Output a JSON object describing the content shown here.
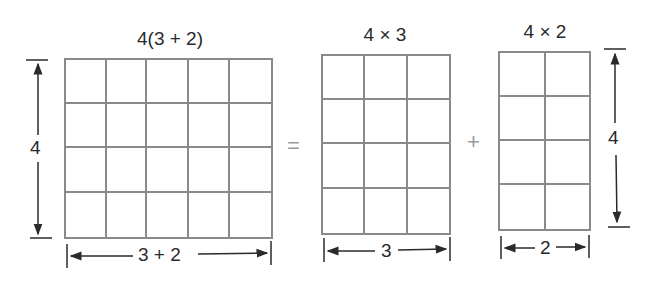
{
  "diagram": {
    "left": {
      "label": "4(3 + 2)",
      "rows": 4,
      "cols": 5,
      "height_label": "4",
      "width_label": "3 + 2"
    },
    "equals": "=",
    "middle": {
      "label": "4 × 3",
      "rows": 4,
      "cols": 3,
      "width_label": "3"
    },
    "plus": "+",
    "right": {
      "label": "4 × 2",
      "rows": 4,
      "cols": 2,
      "height_label": "4",
      "width_label": "2"
    },
    "colors": {
      "grid_line": "#8a8a8a",
      "text": "#2a2a2a",
      "operator": "#9a9a9a"
    }
  }
}
